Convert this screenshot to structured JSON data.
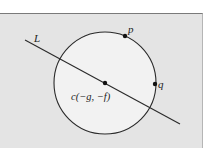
{
  "diagram": {
    "type": "geometry",
    "colors": {
      "page_background": "#ffffff",
      "panel_background": "#e4e4e4",
      "circle_fill": "#f2f2f2",
      "stroke": "#2a2a2a"
    },
    "circle": {
      "cx": 105,
      "cy": 83,
      "r": 51
    },
    "line": {
      "x1": 25,
      "y1": 40,
      "x2": 180,
      "y2": 124
    },
    "labels": {
      "line": "L",
      "point_p": "p",
      "point_q": "q",
      "center": "c(−g, −f)"
    },
    "points": {
      "center": {
        "x": 105,
        "y": 83
      },
      "p": {
        "x": 125,
        "y": 36
      },
      "q": {
        "x": 155,
        "y": 84
      }
    }
  }
}
